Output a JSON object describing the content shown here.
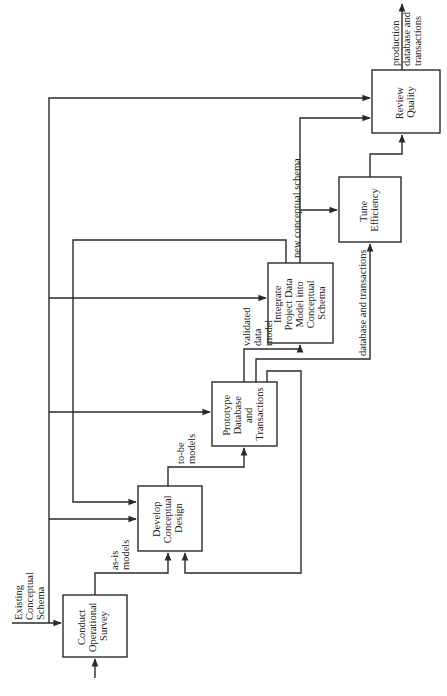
{
  "diagram": {
    "orientation": "rotated-90-ccw",
    "inputs": {
      "existing": [
        "Existing",
        "Conceptual",
        "Schema"
      ]
    },
    "boxes": [
      {
        "id": "conduct",
        "lines": [
          "Conduct",
          "Operational",
          "Survey"
        ]
      },
      {
        "id": "develop",
        "lines": [
          "Develop",
          "Conceptual",
          "Design"
        ]
      },
      {
        "id": "prototype",
        "lines": [
          "Prototype",
          "Database",
          "and",
          "Transactions"
        ]
      },
      {
        "id": "integrate",
        "lines": [
          "Integrate",
          "Project Data",
          "Model into",
          "Conceptual",
          "Schema"
        ]
      },
      {
        "id": "tune",
        "lines": [
          "Tune",
          "Efficiency"
        ]
      },
      {
        "id": "review",
        "lines": [
          "Review",
          "Quality"
        ]
      }
    ],
    "flow_labels": {
      "asis": [
        "as-is",
        "models"
      ],
      "tobe": [
        "to-be",
        "models"
      ],
      "validated": [
        "validated",
        "data",
        "model"
      ],
      "new_schema": "new conceptual schema",
      "db_trans": "database and transactions",
      "output": [
        "production",
        "database and",
        "transactions"
      ]
    },
    "colors": {
      "line": "#2a2a2a",
      "background": "#ffffff"
    }
  }
}
